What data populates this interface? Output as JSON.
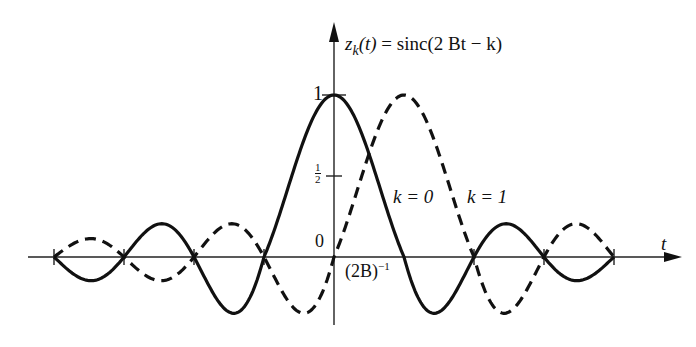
{
  "figure": {
    "title_lhs_var": "z",
    "title_lhs_sub": "k",
    "title_lhs_arg": "(t)",
    "title_eq": "=",
    "title_rhs": "sinc(2 Bt − k)",
    "x_axis_label": "t",
    "y_tick_one": "1",
    "y_tick_half_num": "1",
    "y_tick_half_den": "2",
    "origin_label": "0",
    "x_tick_label_base": "(2B)",
    "x_tick_label_exp": "−1",
    "curve_k0_label": "k = 0",
    "curve_k1_label": "k = 1"
  },
  "chart_data": {
    "type": "line",
    "xlabel": "t",
    "ylabel": "z_k(t)",
    "x_tick_spacing": "(2B)^-1",
    "y_ticks": [
      0,
      0.5,
      1
    ],
    "x_range_in_samples": [
      -4,
      4
    ],
    "series": [
      {
        "name": "k = 0",
        "style": "solid",
        "function": "sinc(2Bt)",
        "peak_at": 0,
        "zeros_at": [
          -4,
          -3,
          -2,
          -1,
          1,
          2,
          3,
          4
        ]
      },
      {
        "name": "k = 1",
        "style": "dashed",
        "function": "sinc(2Bt - 1)",
        "peak_at": 1,
        "zeros_at": [
          -4,
          -3,
          -2,
          -1,
          0,
          2,
          3,
          4
        ]
      }
    ],
    "grid": false,
    "legend": "inline labels"
  }
}
